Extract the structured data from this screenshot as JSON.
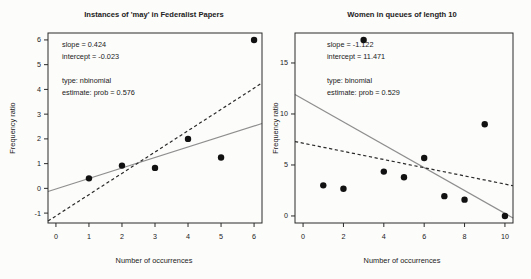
{
  "figure": {
    "background": "#fcfcfb",
    "text_color": "#222222",
    "box_color": "#2a2a2a",
    "point_color": "#111111"
  },
  "chart_data": [
    {
      "type": "scatter",
      "title": "Instances of 'may' in Federalist Papers",
      "xlabel": "Number of occurrences",
      "ylabel": "Frequency ratio",
      "xlim": [
        -0.24,
        6.24
      ],
      "ylim": [
        -1.4,
        6.28
      ],
      "xticks": [
        0,
        1,
        2,
        3,
        4,
        5,
        6
      ],
      "yticks": [
        -1,
        0,
        1,
        2,
        3,
        4,
        5,
        6
      ],
      "grid": false,
      "legend": "none",
      "points": {
        "x": [
          1,
          2,
          3,
          4,
          5,
          6
        ],
        "y": [
          0.404,
          0.921,
          0.828,
          2.0,
          1.25,
          6.0
        ]
      },
      "lines": [
        {
          "name": "weighted-fit",
          "slope": 0.424,
          "intercept": -0.023,
          "style": "solid",
          "color": "#8e8e8e"
        },
        {
          "name": "ols-fit",
          "slope": 0.861,
          "intercept": -1.114,
          "style": "dashed",
          "color": "#2a2a2a"
        }
      ],
      "annotations": [
        "slope = 0.424",
        "intercept = -0.023",
        "",
        "type: nbinomial",
        "estimate: prob = 0.576"
      ]
    },
    {
      "type": "scatter",
      "title": "Women in queues of length 10",
      "xlabel": "Number of occurrences",
      "ylabel": "Frequency ratio",
      "xlim": [
        -0.4,
        10.4
      ],
      "ylim": [
        -0.69,
        17.94
      ],
      "xticks": [
        0,
        2,
        4,
        6,
        8,
        10
      ],
      "yticks": [
        0,
        5,
        10,
        15
      ],
      "grid": false,
      "legend": "none",
      "points": {
        "x": [
          1,
          2,
          3,
          4,
          5,
          6,
          7,
          8,
          9,
          10
        ],
        "y": [
          3.0,
          2.667,
          17.25,
          4.348,
          3.8,
          5.684,
          1.944,
          1.6,
          9.0,
          0.0
        ]
      },
      "lines": [
        {
          "name": "weighted-fit",
          "slope": -1.122,
          "intercept": 11.471,
          "style": "solid",
          "color": "#8e8e8e"
        },
        {
          "name": "ols-fit",
          "slope": -0.401,
          "intercept": 7.136,
          "style": "dashed",
          "color": "#2a2a2a"
        }
      ],
      "annotations": [
        "slope = -1.122",
        "intercept = 11.471",
        "",
        "type: binomial",
        "estimate: prob = 0.529"
      ]
    }
  ]
}
